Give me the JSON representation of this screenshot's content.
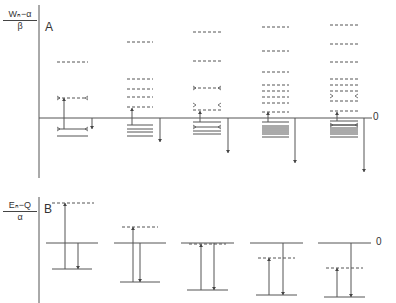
{
  "panelA": {
    "label": "A",
    "ylabel_num": "Wₙ−α",
    "ylabel_den": "β",
    "zero_label": "0",
    "baseline_y": 118,
    "axis": {
      "x": 39,
      "y1": 5,
      "y2": 178
    },
    "columns": [
      {
        "x1": 57,
        "x2": 88,
        "dashed": [
          62,
          98
        ],
        "solid": [
          136
        ],
        "bracketed_dashed": [
          98
        ],
        "bracketed_solid": [
          129
        ],
        "up_arrow": {
          "x": 64,
          "from": 129,
          "to": 98
        },
        "down_arrow": {
          "x": 92,
          "from": 118,
          "to": 129
        }
      },
      {
        "x1": 127,
        "x2": 153,
        "dashed": [
          42,
          79,
          89,
          97,
          107
        ],
        "solid": [
          125,
          129,
          132,
          136
        ],
        "up_arrow": {
          "x": 132,
          "from": 125,
          "to": 108
        },
        "down_arrow": {
          "x": 160,
          "from": 118,
          "to": 142
        }
      },
      {
        "x1": 193,
        "x2": 221,
        "dashed": [
          32,
          61,
          88,
          110
        ],
        "bracketed_dashed": [
          88,
          105
        ],
        "solid": [
          122,
          131,
          134
        ],
        "bracketed_solid": [
          127
        ],
        "up_arrow": {
          "x": 200,
          "from": 122,
          "to": 111
        },
        "down_arrow": {
          "x": 228,
          "from": 118,
          "to": 153
        }
      },
      {
        "x1": 262,
        "x2": 289,
        "dashed": [
          27,
          51,
          72,
          85,
          91,
          97,
          103,
          112
        ],
        "solid": [
          122,
          126,
          128,
          130,
          132,
          134,
          137
        ],
        "up_arrow": {
          "x": 268,
          "from": 122,
          "to": 112
        },
        "down_arrow": {
          "x": 295,
          "from": 118,
          "to": 163
        }
      },
      {
        "x1": 330,
        "x2": 358,
        "dashed": [
          25,
          44,
          62,
          79,
          85,
          91,
          101,
          111
        ],
        "bracketed_dashed": [
          96
        ],
        "solid": [
          121,
          125,
          128,
          130,
          132,
          134,
          137
        ],
        "bracketed_solid": [
          125
        ],
        "up_arrow": {
          "x": 337,
          "from": 121,
          "to": 112
        },
        "down_arrow": {
          "x": 364,
          "from": 118,
          "to": 172
        }
      }
    ]
  },
  "panelB": {
    "label": "B",
    "ylabel_num": "Eₙ−Q",
    "ylabel_den": "α",
    "zero_label": "0",
    "axis": {
      "x": 39,
      "y1": 197,
      "y2": 303
    },
    "columns": [
      {
        "x1": 46,
        "x2": 98,
        "top_dashed": 203,
        "zero": 243,
        "bottom": 269,
        "up_x": 65,
        "down_x": 78
      },
      {
        "x1": 114,
        "x2": 166,
        "top_dashed": 227,
        "zero": 243,
        "bottom": 282,
        "up_x": 133,
        "down_x": 140
      },
      {
        "x1": 181,
        "x2": 234,
        "top_dashed": 244,
        "zero": 243,
        "bottom": 290,
        "up_x": 201,
        "down_x": 214
      },
      {
        "x1": 250,
        "x2": 303,
        "top_dashed": 258,
        "zero": 243,
        "bottom": 295,
        "up_x": 269,
        "down_x": 283
      },
      {
        "x1": 318,
        "x2": 371,
        "top_dashed": 268,
        "zero": 243,
        "bottom": 297,
        "up_x": 337,
        "down_x": 351
      }
    ]
  }
}
